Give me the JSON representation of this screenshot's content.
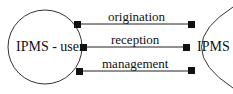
{
  "diagram": {
    "left_node": {
      "label": "IPMS - user"
    },
    "right_node": {
      "label": "IPMS"
    },
    "connections": [
      {
        "label": "origination"
      },
      {
        "label": "reception"
      },
      {
        "label": "management"
      }
    ]
  }
}
